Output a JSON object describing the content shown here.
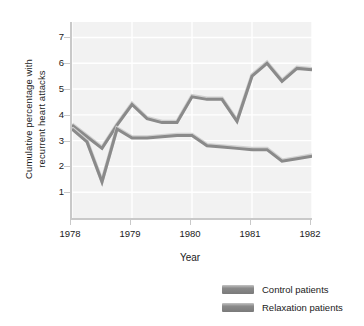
{
  "chart_data": {
    "type": "line",
    "title": "",
    "xlabel": "Year",
    "ylabel": "Cumulative percentage with recurrent heart attacks",
    "ylabel_line1": "Cumulative percentage with",
    "ylabel_line2": "recurrent heart attacks",
    "categories": [
      "1978",
      "1979",
      "1980",
      "1981",
      "1982"
    ],
    "xticks": [
      "1978",
      "1979",
      "1980",
      "1981",
      "1982"
    ],
    "yticks": [
      "1",
      "2",
      "3",
      "4",
      "5",
      "6",
      "7"
    ],
    "xlim": [
      1978,
      1982
    ],
    "ylim": [
      0,
      7.6
    ],
    "grid": true,
    "legend_position": "bottom-right",
    "series": [
      {
        "name": "Control patients",
        "color": "#8a8a8a",
        "x": [
          1978.0,
          1978.25,
          1978.5,
          1978.75,
          1979.0,
          1979.25,
          1979.5,
          1979.75,
          1980.0,
          1980.25,
          1980.5,
          1980.75,
          1981.0,
          1981.25,
          1981.5,
          1981.75,
          1982.0
        ],
        "values": [
          3.6,
          3.15,
          2.7,
          3.6,
          4.4,
          3.85,
          3.7,
          3.7,
          4.7,
          4.6,
          4.6,
          3.75,
          5.5,
          6.0,
          5.3,
          5.8,
          5.75
        ]
      },
      {
        "name": "Relaxation patients",
        "color": "#8a8a8a",
        "x": [
          1978.0,
          1978.25,
          1978.5,
          1978.75,
          1979.0,
          1979.25,
          1979.5,
          1979.75,
          1980.0,
          1980.25,
          1980.5,
          1980.75,
          1981.0,
          1981.25,
          1981.5,
          1981.75,
          1982.0
        ],
        "values": [
          3.45,
          2.95,
          1.4,
          3.45,
          3.1,
          3.1,
          3.15,
          3.2,
          3.2,
          2.8,
          2.75,
          2.7,
          2.65,
          2.65,
          2.2,
          2.3,
          2.4
        ]
      }
    ],
    "legend": [
      {
        "label": "Control patients",
        "color": "#8a8a8a"
      },
      {
        "label": "Relaxation patients",
        "color": "#8a8a8a"
      }
    ],
    "colors": {
      "plot_background": "#f2f2f2",
      "gridline": "#ffffff",
      "axis": "#c9c9c9",
      "line": "#8a8a8a",
      "text": "#1a1a1a"
    }
  }
}
